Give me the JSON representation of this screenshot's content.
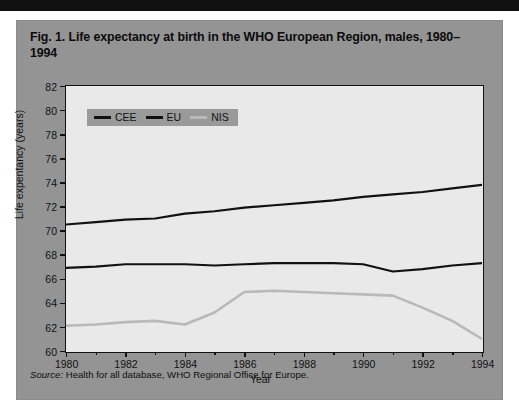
{
  "figure": {
    "title": "Fig. 1. Life expectancy at birth in the WHO European Region, males, 1980–1994",
    "source_label": "Source:",
    "source_text": "Health for all database, WHO Regional Office for Europe."
  },
  "colors": {
    "panel_background": "#949494",
    "plot_background": "#e9e9e9",
    "axis": "#111111",
    "cee": "#111111",
    "eu": "#111111",
    "nis": "#b9b9b9",
    "legend_background": "#9a9a9a",
    "top_rule": "#111111"
  },
  "chart_data": {
    "type": "line",
    "title": "Fig. 1. Life expectancy at birth in the WHO European Region, males, 1980–1994",
    "xlabel": "Year",
    "ylabel": "Life expentancy (years)",
    "xlim": [
      1980,
      1994
    ],
    "ylim": [
      60,
      82
    ],
    "xticks": [
      1980,
      1982,
      1984,
      1986,
      1988,
      1990,
      1992,
      1994
    ],
    "yticks": [
      60,
      62,
      64,
      66,
      68,
      70,
      72,
      74,
      76,
      78,
      80,
      82
    ],
    "grid": false,
    "legend_position": "top-left",
    "x": [
      1980,
      1981,
      1982,
      1983,
      1984,
      1985,
      1986,
      1987,
      1988,
      1989,
      1990,
      1991,
      1992,
      1993,
      1994
    ],
    "series": [
      {
        "name": "CEE",
        "color": "#111111",
        "values": [
          66.9,
          67.0,
          67.2,
          67.2,
          67.2,
          67.1,
          67.2,
          67.3,
          67.3,
          67.3,
          67.2,
          66.6,
          66.8,
          67.1,
          67.3
        ]
      },
      {
        "name": "EU",
        "color": "#111111",
        "values": [
          70.5,
          70.7,
          70.9,
          71.0,
          71.4,
          71.6,
          71.9,
          72.1,
          72.3,
          72.5,
          72.8,
          73.0,
          73.2,
          73.5,
          73.8
        ]
      },
      {
        "name": "NIS",
        "color": "#b9b9b9",
        "values": [
          62.1,
          62.2,
          62.4,
          62.5,
          62.2,
          63.2,
          64.9,
          65.0,
          64.9,
          64.8,
          64.7,
          64.6,
          63.6,
          62.5,
          61.0
        ]
      }
    ]
  },
  "legend": {
    "items": [
      {
        "label": "CEE",
        "color": "#111111"
      },
      {
        "label": "EU",
        "color": "#111111"
      },
      {
        "label": "NIS",
        "color": "#b9b9b9"
      }
    ]
  }
}
